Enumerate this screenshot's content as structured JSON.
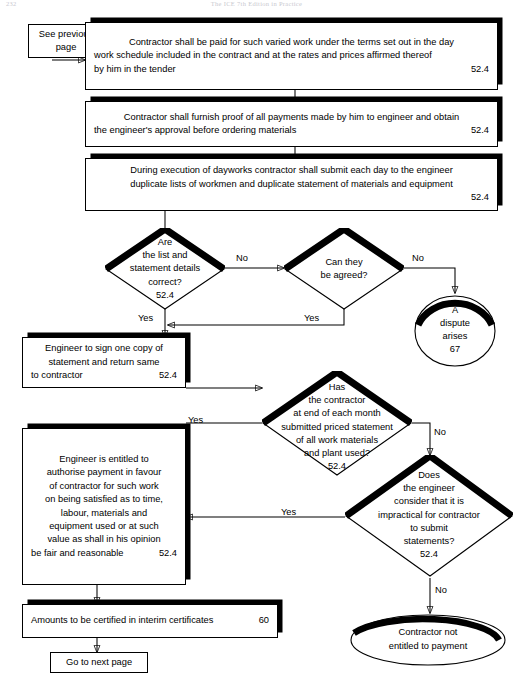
{
  "page": {
    "running_head_left": "232",
    "running_head_center": "The ICE 7th Edition in Practice",
    "width": 513,
    "height": 681,
    "ink_color": "#000000",
    "paper_color": "#ffffff"
  },
  "connector_in": {
    "label": "See previous\npage",
    "line1": "See previous",
    "line2": "page"
  },
  "boxes": {
    "paid_varied_work": {
      "line1": "Contractor shall be paid for such varied work under the terms set out in the day",
      "line2": "work schedule included in the contract and at the rates and prices affirmed thereof",
      "line3": "by him in the tender",
      "clause": "52.4"
    },
    "furnish_proof": {
      "line1": "Contractor shall furnish proof of all payments made by him to engineer and obtain",
      "line2": "the engineer's approval before ordering materials",
      "clause": "52.4"
    },
    "dayworks_lists": {
      "line1": "During execution of dayworks contractor shall submit each day to the engineer",
      "line2": "duplicate lists of workmen and duplicate statement of materials and equipment",
      "clause": "52.4"
    },
    "engineer_sign": {
      "line1": "Engineer to sign one copy of",
      "line2": "statement and return same",
      "line3": "to contractor",
      "clause": "52.4"
    },
    "authorise_payment": {
      "line1": "Engineer is entitled to",
      "line2": "authorise payment in favour",
      "line3": "of contractor for such work",
      "line4": "on being satisfied as to time,",
      "line5": "labour, materials and",
      "line6": "equipment used or at such",
      "line7": "value as shall in his opinion",
      "line8": "be fair and reasonable",
      "clause": "52.4"
    },
    "interim_certificates": {
      "line1": "Amounts to be certified in interim certificates",
      "clause": "60"
    }
  },
  "decisions": {
    "list_correct": {
      "line1": "Are",
      "line2": "the list and",
      "line3": "statement details",
      "line4": "correct?",
      "clause": "52.4"
    },
    "can_be_agreed": {
      "line1": "Can they",
      "line2": "be agreed?"
    },
    "submitted_priced_statement": {
      "line1": "Has",
      "line2": "the contractor",
      "line3": "at end of each month",
      "line4": "submitted priced statement",
      "line5": "of all work materials",
      "line6": "and plant used?",
      "clause": "52.4"
    },
    "impractical_to_submit": {
      "line1": "Does",
      "line2": "the engineer",
      "line3": "consider that it is",
      "line4": "impractical for contractor",
      "line5": "to submit",
      "line6": "statements?",
      "clause": "52.4"
    }
  },
  "terminators": {
    "dispute": {
      "line1": "A",
      "line2": "dispute",
      "line3": "arises",
      "clause": "67"
    },
    "not_entitled": {
      "line1": "Contractor not",
      "line2": "entitled to payment"
    },
    "next_page": {
      "label": "Go to next page"
    }
  },
  "edge_labels": {
    "list_correct_no": "No",
    "list_correct_yes": "Yes",
    "can_be_agreed_no": "No",
    "can_be_agreed_yes": "Yes",
    "submitted_yes": "Yes",
    "submitted_no": "No",
    "impractical_yes": "Yes",
    "impractical_no": "No"
  }
}
